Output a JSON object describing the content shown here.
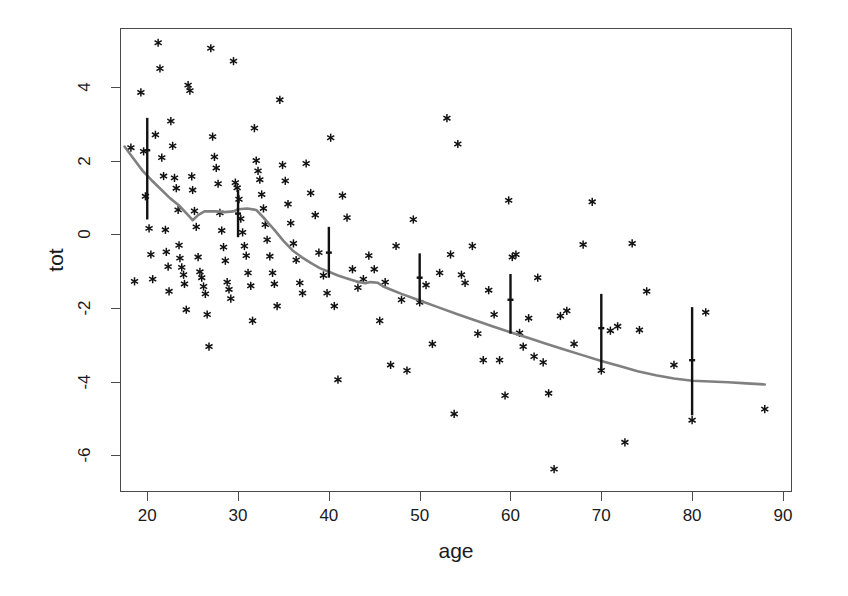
{
  "chart_data": {
    "type": "scatter",
    "title": "",
    "xlabel": "age",
    "ylabel": "tot",
    "xlim": [
      17.0,
      91.0
    ],
    "ylim": [
      -7.0,
      5.6
    ],
    "xticks": [
      20,
      30,
      40,
      50,
      60,
      70,
      80,
      90
    ],
    "yticks": [
      -6,
      -4,
      -2,
      0,
      2,
      4
    ],
    "grid": false,
    "legend": "none",
    "point_marker": "asterisk",
    "point_color": "#111111",
    "smooth_color": "#808080",
    "errorbar_color": "#111111",
    "points": [
      [
        18.2,
        2.35
      ],
      [
        18.6,
        -1.28
      ],
      [
        19.3,
        3.85
      ],
      [
        19.6,
        2.25
      ],
      [
        19.8,
        1.03
      ],
      [
        20.2,
        0.16
      ],
      [
        20.4,
        -0.55
      ],
      [
        20.6,
        -1.22
      ],
      [
        20.9,
        2.7
      ],
      [
        21.2,
        5.2
      ],
      [
        21.4,
        4.5
      ],
      [
        21.6,
        2.08
      ],
      [
        21.8,
        1.58
      ],
      [
        22.0,
        0.12
      ],
      [
        22.1,
        -0.48
      ],
      [
        22.3,
        -0.88
      ],
      [
        22.4,
        -1.55
      ],
      [
        22.6,
        3.07
      ],
      [
        22.8,
        2.4
      ],
      [
        23.0,
        1.53
      ],
      [
        23.2,
        1.25
      ],
      [
        23.4,
        0.66
      ],
      [
        23.5,
        -0.3
      ],
      [
        23.6,
        -0.65
      ],
      [
        23.8,
        -0.9
      ],
      [
        24.0,
        -1.1
      ],
      [
        24.1,
        -1.35
      ],
      [
        24.3,
        -2.05
      ],
      [
        24.5,
        4.05
      ],
      [
        24.7,
        3.9
      ],
      [
        24.9,
        1.57
      ],
      [
        25.0,
        1.2
      ],
      [
        25.2,
        0.63
      ],
      [
        25.4,
        0.2
      ],
      [
        25.6,
        -0.62
      ],
      [
        25.8,
        -1.02
      ],
      [
        26.0,
        -1.18
      ],
      [
        26.2,
        -1.42
      ],
      [
        26.4,
        -1.62
      ],
      [
        26.6,
        -2.18
      ],
      [
        26.8,
        -3.05
      ],
      [
        27.0,
        5.05
      ],
      [
        27.2,
        2.65
      ],
      [
        27.4,
        2.1
      ],
      [
        27.6,
        1.8
      ],
      [
        27.8,
        1.37
      ],
      [
        28.0,
        0.58
      ],
      [
        28.2,
        0.1
      ],
      [
        28.4,
        -0.35
      ],
      [
        28.6,
        -0.72
      ],
      [
        28.8,
        -1.3
      ],
      [
        29.0,
        -1.5
      ],
      [
        29.2,
        -1.75
      ],
      [
        29.5,
        4.7
      ],
      [
        29.7,
        1.4
      ],
      [
        29.9,
        1.26
      ],
      [
        30.1,
        0.95
      ],
      [
        30.3,
        0.42
      ],
      [
        30.5,
        0.05
      ],
      [
        30.7,
        -0.32
      ],
      [
        30.9,
        -0.58
      ],
      [
        31.1,
        -1.05
      ],
      [
        31.4,
        -1.4
      ],
      [
        31.6,
        -2.35
      ],
      [
        31.8,
        2.88
      ],
      [
        32.0,
        2.0
      ],
      [
        32.2,
        1.72
      ],
      [
        32.4,
        1.48
      ],
      [
        32.6,
        1.08
      ],
      [
        32.8,
        0.7
      ],
      [
        33.0,
        0.26
      ],
      [
        33.2,
        -0.15
      ],
      [
        33.5,
        -0.6
      ],
      [
        33.8,
        -1.05
      ],
      [
        34.0,
        -1.35
      ],
      [
        34.3,
        -1.95
      ],
      [
        34.6,
        3.65
      ],
      [
        34.9,
        1.88
      ],
      [
        35.2,
        1.45
      ],
      [
        35.5,
        0.82
      ],
      [
        35.8,
        0.3
      ],
      [
        36.1,
        -0.25
      ],
      [
        36.4,
        -0.7
      ],
      [
        36.8,
        -1.32
      ],
      [
        37.1,
        -1.6
      ],
      [
        37.5,
        1.92
      ],
      [
        38.0,
        1.12
      ],
      [
        38.5,
        0.52
      ],
      [
        38.9,
        -0.5
      ],
      [
        39.4,
        -1.12
      ],
      [
        39.8,
        -1.6
      ],
      [
        40.2,
        2.62
      ],
      [
        40.6,
        -1.95
      ],
      [
        41.0,
        -3.95
      ],
      [
        41.5,
        1.05
      ],
      [
        42.0,
        0.45
      ],
      [
        42.6,
        -0.95
      ],
      [
        43.2,
        -1.45
      ],
      [
        43.8,
        -1.22
      ],
      [
        44.4,
        -0.58
      ],
      [
        45.0,
        -0.95
      ],
      [
        45.6,
        -2.35
      ],
      [
        46.2,
        -1.3
      ],
      [
        46.8,
        -3.55
      ],
      [
        47.4,
        -0.32
      ],
      [
        48.0,
        -1.78
      ],
      [
        48.6,
        -3.7
      ],
      [
        49.3,
        0.4
      ],
      [
        50.0,
        -1.85
      ],
      [
        50.7,
        -1.38
      ],
      [
        51.4,
        -2.98
      ],
      [
        52.2,
        -1.05
      ],
      [
        53.0,
        3.15
      ],
      [
        53.4,
        -0.55
      ],
      [
        53.8,
        -4.88
      ],
      [
        54.2,
        2.45
      ],
      [
        54.6,
        -1.1
      ],
      [
        55.0,
        -1.32
      ],
      [
        55.8,
        -0.32
      ],
      [
        56.4,
        -2.7
      ],
      [
        57.0,
        -3.42
      ],
      [
        57.6,
        -1.52
      ],
      [
        58.2,
        -2.18
      ],
      [
        58.8,
        -3.42
      ],
      [
        59.4,
        -4.38
      ],
      [
        59.8,
        0.92
      ],
      [
        60.2,
        -0.62
      ],
      [
        60.6,
        -0.55
      ],
      [
        61.0,
        -2.68
      ],
      [
        61.4,
        -3.05
      ],
      [
        62.0,
        -2.28
      ],
      [
        62.6,
        -3.32
      ],
      [
        63.0,
        -1.18
      ],
      [
        63.6,
        -3.48
      ],
      [
        64.2,
        -4.32
      ],
      [
        64.8,
        -6.38
      ],
      [
        65.5,
        -2.22
      ],
      [
        66.2,
        -2.08
      ],
      [
        67.0,
        -2.98
      ],
      [
        68.0,
        -0.28
      ],
      [
        69.0,
        0.88
      ],
      [
        70.0,
        -3.7
      ],
      [
        71.0,
        -2.62
      ],
      [
        71.8,
        -2.5
      ],
      [
        72.6,
        -5.65
      ],
      [
        73.4,
        -0.25
      ],
      [
        74.2,
        -2.6
      ],
      [
        75.0,
        -1.55
      ],
      [
        78.0,
        -3.55
      ],
      [
        80.0,
        -5.05
      ],
      [
        81.5,
        -2.12
      ],
      [
        88.0,
        -4.75
      ]
    ],
    "smooth_curve": [
      [
        17.5,
        2.38
      ],
      [
        18.5,
        2.05
      ],
      [
        19.5,
        1.72
      ],
      [
        20.5,
        1.46
      ],
      [
        21.5,
        1.22
      ],
      [
        22.5,
        0.98
      ],
      [
        23.5,
        0.78
      ],
      [
        24.5,
        0.52
      ],
      [
        25.0,
        0.38
      ],
      [
        25.6,
        0.52
      ],
      [
        26.3,
        0.62
      ],
      [
        27.5,
        0.62
      ],
      [
        28.5,
        0.6
      ],
      [
        29.5,
        0.62
      ],
      [
        30.0,
        0.68
      ],
      [
        31.0,
        0.7
      ],
      [
        32.0,
        0.66
      ],
      [
        33.0,
        0.4
      ],
      [
        34.0,
        0.12
      ],
      [
        35.0,
        -0.18
      ],
      [
        36.0,
        -0.44
      ],
      [
        37.0,
        -0.62
      ],
      [
        38.0,
        -0.78
      ],
      [
        39.0,
        -0.92
      ],
      [
        40.0,
        -1.02
      ],
      [
        41.0,
        -1.12
      ],
      [
        42.0,
        -1.2
      ],
      [
        43.0,
        -1.28
      ],
      [
        44.0,
        -1.33
      ],
      [
        44.6,
        -1.3
      ],
      [
        45.4,
        -1.32
      ],
      [
        46.0,
        -1.42
      ],
      [
        47.0,
        -1.52
      ],
      [
        48.0,
        -1.62
      ],
      [
        50.0,
        -1.8
      ],
      [
        52.0,
        -1.98
      ],
      [
        54.0,
        -2.16
      ],
      [
        56.0,
        -2.33
      ],
      [
        58.0,
        -2.5
      ],
      [
        60.0,
        -2.66
      ],
      [
        62.0,
        -2.82
      ],
      [
        64.0,
        -2.98
      ],
      [
        66.0,
        -3.14
      ],
      [
        68.0,
        -3.29
      ],
      [
        70.0,
        -3.44
      ],
      [
        72.0,
        -3.58
      ],
      [
        74.0,
        -3.72
      ],
      [
        76.0,
        -3.83
      ],
      [
        78.0,
        -3.92
      ],
      [
        80.0,
        -3.98
      ],
      [
        82.0,
        -4.0
      ],
      [
        84.0,
        -4.02
      ],
      [
        86.0,
        -4.05
      ],
      [
        88.0,
        -4.08
      ]
    ],
    "error_bars": [
      {
        "x": 20,
        "low": 0.4,
        "high": 3.16,
        "center": 2.28
      },
      {
        "x": 30,
        "low": -0.08,
        "high": 1.2,
        "center": 0.56
      },
      {
        "x": 40,
        "low": -1.18,
        "high": 0.2,
        "center": -0.5
      },
      {
        "x": 50,
        "low": -1.85,
        "high": -0.52,
        "center": -1.18
      },
      {
        "x": 60,
        "low": -2.7,
        "high": -1.08,
        "center": -1.78
      },
      {
        "x": 70,
        "low": -3.68,
        "high": -1.62,
        "center": -2.55
      },
      {
        "x": 80,
        "low": -4.92,
        "high": -1.98,
        "center": -3.42
      }
    ]
  },
  "axis": {
    "x_title": "age",
    "y_title": "tot",
    "x_tick_labels": [
      "20",
      "30",
      "40",
      "50",
      "60",
      "70",
      "80",
      "90"
    ],
    "y_tick_labels": [
      "-6",
      "-4",
      "-2",
      "0",
      "2",
      "4"
    ]
  }
}
